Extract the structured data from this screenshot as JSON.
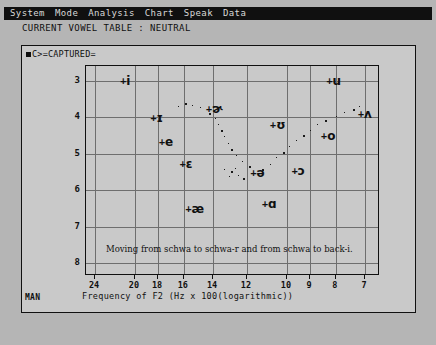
{
  "menubar": {
    "items": [
      {
        "label": "System"
      },
      {
        "label": "Mode"
      },
      {
        "label": "Analysis"
      },
      {
        "label": "Chart"
      },
      {
        "label": "Speak"
      },
      {
        "label": "Data"
      }
    ]
  },
  "status": {
    "line": "CURRENT VOWEL TABLE : NEUTRAL"
  },
  "panel": {
    "title": "C>=CAPTURED=",
    "corner_tag": "MAN"
  },
  "chart_data": {
    "type": "scatter",
    "title": "",
    "xlabel": "Frequency of F2 (Hz x 100(logarithmic))",
    "ylabel": "Frequency of F1 (Hz x 100(linear))",
    "xscale": "logarithmic",
    "yscale": "linear",
    "grid": true,
    "legend": null,
    "annotation": "Moving from schwa to schwa-r and from schwa to back-i.",
    "xticks": [
      24,
      20,
      18,
      16,
      14,
      12,
      10,
      9,
      8,
      7
    ],
    "yticks": [
      3,
      4,
      5,
      6,
      7,
      8
    ],
    "xlim": [
      25,
      6.6
    ],
    "ylim": [
      2.6,
      8.3
    ],
    "points": [
      {
        "label": "i",
        "x": 21.0,
        "y": 3.05
      },
      {
        "label": "u",
        "x": 8.2,
        "y": 3.05
      },
      {
        "label": "ɪ",
        "x": 18.3,
        "y": 4.05
      },
      {
        "label": "ɚ",
        "x": 14.2,
        "y": 3.8
      },
      {
        "label": "ʌ",
        "x": 7.1,
        "y": 3.95
      },
      {
        "label": "ʊ",
        "x": 10.6,
        "y": 4.25
      },
      {
        "label": "e",
        "x": 17.6,
        "y": 4.7
      },
      {
        "label": "o",
        "x": 8.4,
        "y": 4.55
      },
      {
        "label": "ɛ",
        "x": 16.0,
        "y": 5.3
      },
      {
        "label": "ə",
        "x": 11.6,
        "y": 5.55
      },
      {
        "label": "ɔ",
        "x": 9.6,
        "y": 5.5
      },
      {
        "label": "æ",
        "x": 15.6,
        "y": 6.55
      },
      {
        "label": "ɑ",
        "x": 11.0,
        "y": 6.4
      }
    ],
    "trails": [
      {
        "name": "schwa-to-schwa-r",
        "from": "ə",
        "to": "ɚ",
        "points": [
          {
            "x": 11.9,
            "y": 5.35
          },
          {
            "x": 12.3,
            "y": 5.2
          },
          {
            "x": 12.6,
            "y": 5.05
          },
          {
            "x": 12.9,
            "y": 4.88
          },
          {
            "x": 13.1,
            "y": 4.7
          },
          {
            "x": 13.3,
            "y": 4.52
          },
          {
            "x": 13.5,
            "y": 4.34
          },
          {
            "x": 13.7,
            "y": 4.18
          },
          {
            "x": 13.9,
            "y": 4.02
          },
          {
            "x": 14.3,
            "y": 3.88
          },
          {
            "x": 14.9,
            "y": 3.72
          },
          {
            "x": 15.4,
            "y": 3.66
          },
          {
            "x": 15.9,
            "y": 3.62
          },
          {
            "x": 16.4,
            "y": 3.7
          }
        ]
      },
      {
        "name": "schwa-to-back-i",
        "from": "ə",
        "to": "ʌ",
        "points": [
          {
            "x": 11.2,
            "y": 5.42
          },
          {
            "x": 10.8,
            "y": 5.28
          },
          {
            "x": 10.5,
            "y": 5.1
          },
          {
            "x": 10.2,
            "y": 4.95
          },
          {
            "x": 9.9,
            "y": 4.8
          },
          {
            "x": 9.6,
            "y": 4.64
          },
          {
            "x": 9.3,
            "y": 4.48
          },
          {
            "x": 9.0,
            "y": 4.34
          },
          {
            "x": 8.7,
            "y": 4.2
          },
          {
            "x": 8.4,
            "y": 4.08
          },
          {
            "x": 8.0,
            "y": 3.96
          },
          {
            "x": 7.7,
            "y": 3.86
          },
          {
            "x": 7.4,
            "y": 3.78
          },
          {
            "x": 7.2,
            "y": 3.7
          }
        ]
      },
      {
        "name": "schwa-cluster-left",
        "from": "ə",
        "to": "ə",
        "points": [
          {
            "x": 12.9,
            "y": 5.48
          },
          {
            "x": 13.3,
            "y": 5.42
          },
          {
            "x": 12.5,
            "y": 5.58
          },
          {
            "x": 12.2,
            "y": 5.66
          },
          {
            "x": 13.0,
            "y": 5.62
          },
          {
            "x": 12.7,
            "y": 5.4
          }
        ]
      }
    ]
  }
}
